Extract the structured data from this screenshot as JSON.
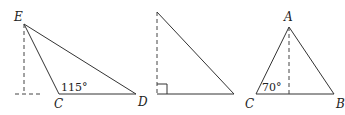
{
  "colors": {
    "background": "#ffffff",
    "stroke": "#333333",
    "dashed": "#444444",
    "text": "#222222"
  },
  "figures": [
    {
      "id": "figure-1",
      "description": "Obtuse triangle ECD with exterior dashed altitude from E",
      "labels": {
        "E": "E",
        "C": "C",
        "D": "D",
        "angle": "115°"
      },
      "points": {
        "E": [
          24,
          24
        ],
        "C": [
          59,
          94
        ],
        "D": [
          136,
          94
        ],
        "foot": [
          24,
          94
        ],
        "ext_left": [
          15,
          94
        ]
      }
    },
    {
      "id": "figure-2",
      "description": "Right triangle with dashed vertical leg and right-angle marker",
      "labels": {},
      "points": {
        "top": [
          157,
          12
        ],
        "corner": [
          157,
          94
        ],
        "right": [
          234,
          94
        ]
      }
    },
    {
      "id": "figure-3",
      "description": "Triangle ACB with dashed altitude from A",
      "labels": {
        "A": "A",
        "C": "C",
        "B": "B",
        "angle": "70°"
      },
      "points": {
        "A": [
          289,
          27
        ],
        "C": [
          256,
          94
        ],
        "B": [
          334,
          94
        ],
        "foot": [
          289,
          94
        ]
      }
    }
  ]
}
